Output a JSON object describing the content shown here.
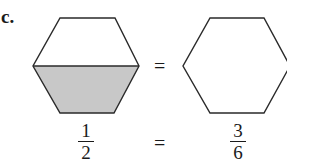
{
  "label": "c.",
  "figures": {
    "left_hexagon": {
      "shaded_part": "bottom half",
      "fill": "#c8c8c8",
      "stroke": "#2a2a2a"
    },
    "right_hexagon": {
      "shaded_part": "none",
      "stroke": "#2a2a2a"
    },
    "equals_top": "="
  },
  "equation": {
    "left_fraction": {
      "numerator": "1",
      "denominator": "2"
    },
    "equals": "=",
    "right_fraction": {
      "numerator": "3",
      "denominator": "6"
    }
  }
}
